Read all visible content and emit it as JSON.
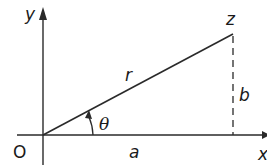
{
  "diagram": {
    "type": "complex-plane-argand",
    "labels": {
      "y_axis": "y",
      "x_axis": "x",
      "origin": "O",
      "point": "z",
      "modulus": "r",
      "real_part": "a",
      "imag_part": "b",
      "angle": "θ"
    },
    "colors": {
      "line": "#2a2a2a",
      "text": "#1a1a1a",
      "background": "#ffffff"
    },
    "geometry": {
      "origin": [
        43,
        135
      ],
      "point_z": [
        233,
        34
      ],
      "x_axis_range": [
        17,
        267
      ],
      "y_axis_range": [
        165,
        8
      ],
      "angle_arc_radius": 50
    }
  }
}
